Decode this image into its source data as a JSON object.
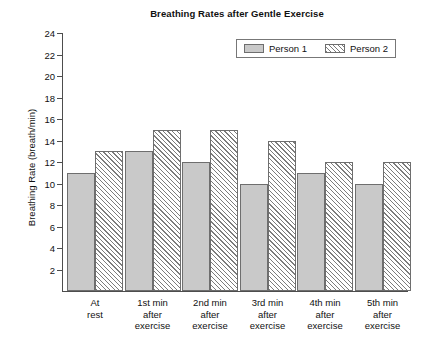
{
  "chart_data": {
    "type": "bar",
    "title": "Breathing Rates after Gentle Exercise",
    "xlabel": "",
    "ylabel": "Breathing Rate (breath/min)",
    "categories": [
      "At rest",
      "1st min after exercise",
      "2nd min after exercise",
      "3rd min after exercise",
      "4th min after exercise",
      "5th min after exercise"
    ],
    "category_lines": [
      [
        "At",
        "rest"
      ],
      [
        "1st min",
        "after",
        "exercise"
      ],
      [
        "2nd min",
        "after",
        "exercise"
      ],
      [
        "3rd min",
        "after",
        "exercise"
      ],
      [
        "4th min",
        "after",
        "exercise"
      ],
      [
        "5th min",
        "after",
        "exercise"
      ]
    ],
    "series": [
      {
        "name": "Person 1",
        "values": [
          11,
          13,
          12,
          10,
          11,
          10
        ],
        "color": "#c9c9c9",
        "pattern": "solid-fill"
      },
      {
        "name": "Person 2",
        "values": [
          13,
          15,
          15,
          14,
          12,
          12
        ],
        "color": "#ffffff",
        "pattern": "diagonal-hatch"
      }
    ],
    "ylim": [
      0,
      24
    ],
    "ytick_step": 2,
    "yticks": [
      2,
      4,
      6,
      8,
      10,
      12,
      14,
      16,
      18,
      20,
      22,
      24
    ],
    "ytick_labels": [
      "2",
      "4",
      "6",
      "8",
      "10",
      "12",
      "14",
      "16",
      "18",
      "20",
      "22",
      "24"
    ],
    "grid": false,
    "legend_position": "top-right",
    "legend_entries": [
      "Person 1",
      "Person 2"
    ]
  }
}
